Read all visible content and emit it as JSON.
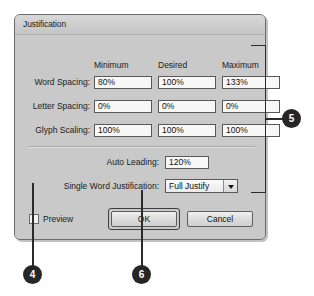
{
  "dialog": {
    "title": "Justification",
    "column_headers": [
      "Minimum",
      "Desired",
      "Maximum"
    ],
    "rows": [
      {
        "label": "Word Spacing:",
        "minimum": "80%",
        "desired": "100%",
        "maximum": "133%"
      },
      {
        "label": "Letter Spacing:",
        "minimum": "0%",
        "desired": "0%",
        "maximum": "0%"
      },
      {
        "label": "Glyph Scaling:",
        "minimum": "100%",
        "desired": "100%",
        "maximum": "100%"
      }
    ],
    "auto_leading": {
      "label": "Auto Leading:",
      "value": "120%"
    },
    "single_word_justification": {
      "label": "Single Word Justification:",
      "value": "Full Justify",
      "arrow_icon": "chevron-down-icon"
    },
    "preview": {
      "label": "Preview",
      "checked": false
    },
    "buttons": {
      "ok": "OK",
      "cancel": "Cancel"
    }
  },
  "callouts": [
    {
      "number": "4",
      "target": "preview-checkbox"
    },
    {
      "number": "5",
      "target": "justification-fields-group"
    },
    {
      "number": "6",
      "target": "ok-button"
    }
  ],
  "colors": {
    "dialog_background": "#c9c9c9",
    "titlebar": "#d2d2d2",
    "field_background": "#f7f7f7",
    "border": "#595959",
    "badge_background": "#262626",
    "badge_text": "#ffffff",
    "callout_line": "#2b2b2b"
  }
}
